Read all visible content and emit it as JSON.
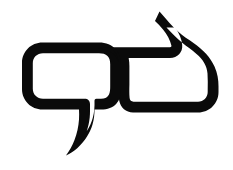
{
  "canvas": {
    "width": 233,
    "height": 170,
    "background_color": "#ffffff",
    "alt_text": "Two overlapping speech bubbles outline icon"
  },
  "graphic": {
    "name": "double-speech-bubble-icon",
    "type": "line-art-icon",
    "stroke_color": "#0a0a0a",
    "fill_color": "#ffffff",
    "stroke_width": 11,
    "shapes": [
      {
        "name": "left-speech-bubble",
        "shape": "rounded-rectangle-with-tail",
        "x": 22,
        "y": 48,
        "width": 105,
        "height": 60,
        "corner_radius": 20,
        "tail_direction": "down-left",
        "tail_tip_x": 62,
        "tail_tip_y": 152
      },
      {
        "name": "right-speech-bubble",
        "shape": "rounded-rectangle-with-tail",
        "x": 118,
        "y": 48,
        "width": 97,
        "height": 62,
        "corner_radius": 22,
        "tail_direction": "up-left",
        "tail_tip_x": 160,
        "tail_tip_y": 12
      }
    ]
  }
}
